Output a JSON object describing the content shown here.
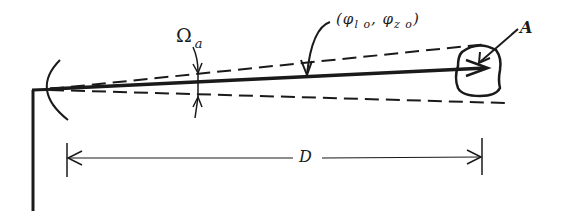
{
  "diagram": {
    "type": "geometry-schematic",
    "labels": {
      "solid_angle": "Ω",
      "solid_angle_sub": "a",
      "direction_open": "(",
      "phi_l": "φ",
      "phi_l_sub": "l o",
      "separator": ", ",
      "phi_z": "φ",
      "phi_z_sub": "z o",
      "direction_close": ")",
      "area": "A",
      "distance": "D"
    },
    "elements": [
      "mast",
      "antenna-dish-arc",
      "beam-axis-arrow",
      "upper-beam-edge-dashed",
      "lower-beam-edge-dashed",
      "solid-angle-indicator-arrows",
      "direction-leader-arrow",
      "target-area-blob",
      "area-leader-arrow",
      "distance-dimension-line"
    ],
    "colors": {
      "ink": "#1a1a1a",
      "background": "#ffffff"
    }
  }
}
